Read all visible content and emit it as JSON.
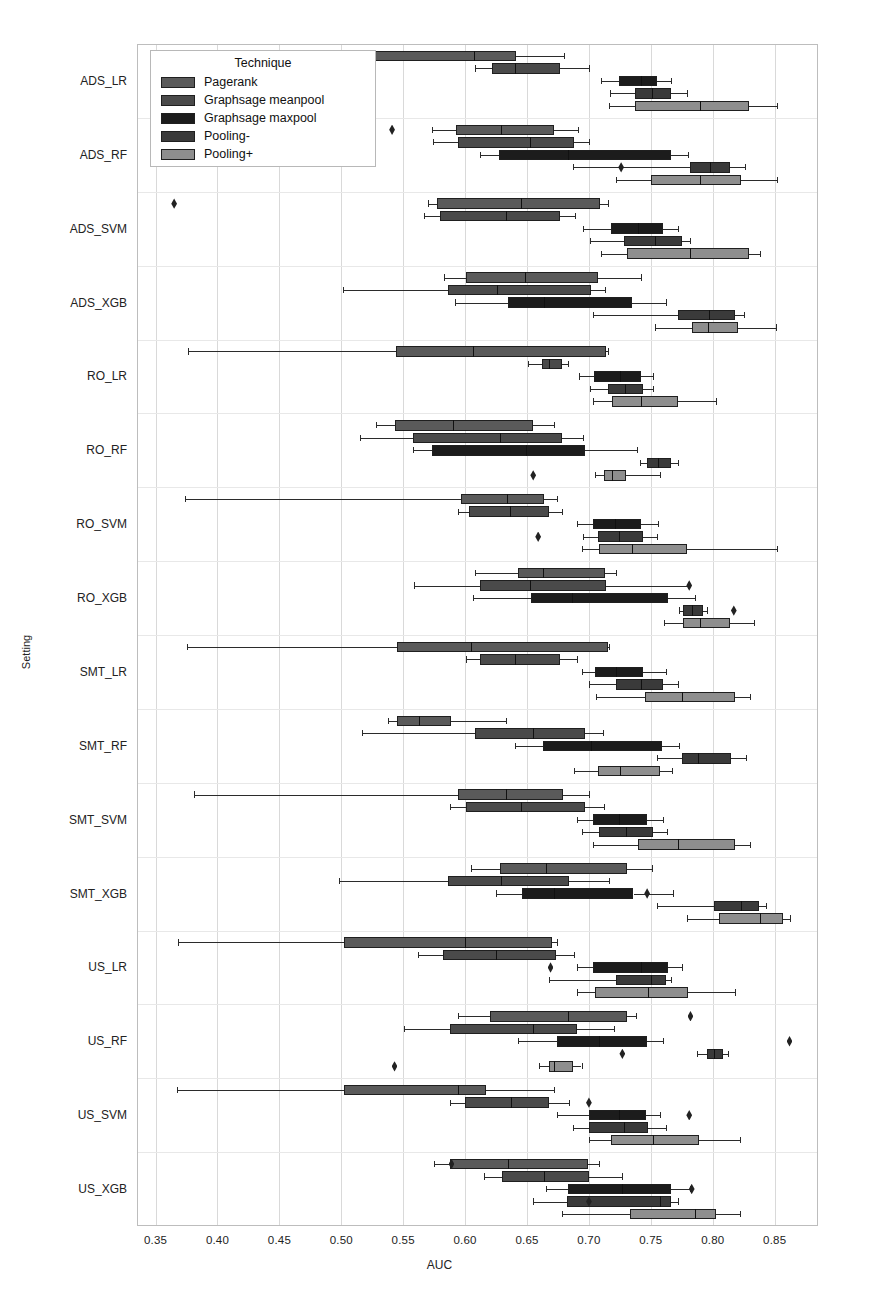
{
  "figure": {
    "width": 879,
    "height": 1304,
    "background": "#ffffff"
  },
  "legend": {
    "title": "Technique",
    "entries": [
      {
        "label": "Pagerank",
        "color": "#5a5a5a"
      },
      {
        "label": "Graphsage meanpool",
        "color": "#4a4a4a"
      },
      {
        "label": "Graphsage maxpool",
        "color": "#1c1c1c"
      },
      {
        "label": "Pooling-",
        "color": "#3a3a3a"
      },
      {
        "label": "Pooling+",
        "color": "#8e8e8e"
      }
    ]
  },
  "axes": {
    "xlabel": "AUC",
    "ylabel": "Setting",
    "xticks": [
      "0.35",
      "0.40",
      "0.45",
      "0.50",
      "0.55",
      "0.60",
      "0.65",
      "0.70",
      "0.75",
      "0.80",
      "0.85"
    ],
    "xtick_values": [
      0.35,
      0.4,
      0.45,
      0.5,
      0.55,
      0.6,
      0.65,
      0.7,
      0.75,
      0.8,
      0.85
    ],
    "xlim": [
      0.335,
      0.885
    ],
    "grid": "vertical"
  },
  "chart_data": {
    "type": "box",
    "orientation": "horizontal",
    "title": "",
    "xlabel": "AUC",
    "ylabel": "Setting",
    "xlim": [
      0.335,
      0.885
    ],
    "xticks": [
      0.35,
      0.4,
      0.45,
      0.5,
      0.55,
      0.6,
      0.65,
      0.7,
      0.75,
      0.8,
      0.85
    ],
    "legend_title": "Technique",
    "legend_position": "upper left",
    "categories": [
      "ADS_LR",
      "ADS_RF",
      "ADS_SVM",
      "ADS_XGB",
      "RO_LR",
      "RO_RF",
      "RO_SVM",
      "RO_XGB",
      "SMT_LR",
      "SMT_RF",
      "SMT_SVM",
      "SMT_XGB",
      "US_LR",
      "US_RF",
      "US_SVM",
      "US_XGB"
    ],
    "series": [
      {
        "name": "Pagerank",
        "color": "#5a5a5a"
      },
      {
        "name": "Graphsage meanpool",
        "color": "#4a4a4a"
      },
      {
        "name": "Graphsage maxpool",
        "color": "#1c1c1c"
      },
      {
        "name": "Pooling-",
        "color": "#3a3a3a"
      },
      {
        "name": "Pooling+",
        "color": "#8e8e8e"
      }
    ],
    "boxes": [
      {
        "setting": "ADS_LR",
        "technique": "Pagerank",
        "whislo": 0.527,
        "q1": 0.527,
        "med": 0.607,
        "q3": 0.641,
        "whishi": 0.68,
        "fliers": []
      },
      {
        "setting": "ADS_LR",
        "technique": "Graphsage meanpool",
        "whislo": 0.608,
        "q1": 0.622,
        "med": 0.64,
        "q3": 0.677,
        "whishi": 0.7,
        "fliers": []
      },
      {
        "setting": "ADS_LR",
        "technique": "Graphsage maxpool",
        "whislo": 0.71,
        "q1": 0.724,
        "med": 0.742,
        "q3": 0.755,
        "whishi": 0.766,
        "fliers": []
      },
      {
        "setting": "ADS_LR",
        "technique": "Pooling-",
        "whislo": 0.717,
        "q1": 0.737,
        "med": 0.751,
        "q3": 0.766,
        "whishi": 0.779,
        "fliers": []
      },
      {
        "setting": "ADS_LR",
        "technique": "Pooling+",
        "whislo": 0.716,
        "q1": 0.737,
        "med": 0.79,
        "q3": 0.829,
        "whishi": 0.852,
        "fliers": []
      },
      {
        "setting": "ADS_RF",
        "technique": "Pagerank",
        "whislo": 0.573,
        "q1": 0.593,
        "med": 0.629,
        "q3": 0.672,
        "whishi": 0.691,
        "fliers": [
          0.541
        ]
      },
      {
        "setting": "ADS_RF",
        "technique": "Graphsage meanpool",
        "whislo": 0.574,
        "q1": 0.594,
        "med": 0.652,
        "q3": 0.688,
        "whishi": 0.7,
        "fliers": []
      },
      {
        "setting": "ADS_RF",
        "technique": "Graphsage maxpool",
        "whislo": 0.612,
        "q1": 0.627,
        "med": 0.683,
        "q3": 0.766,
        "whishi": 0.78,
        "fliers": []
      },
      {
        "setting": "ADS_RF",
        "technique": "Pooling-",
        "whislo": 0.687,
        "q1": 0.782,
        "med": 0.798,
        "q3": 0.814,
        "whishi": 0.826,
        "fliers": [
          0.726
        ]
      },
      {
        "setting": "ADS_RF",
        "technique": "Pooling+",
        "whislo": 0.722,
        "q1": 0.75,
        "med": 0.79,
        "q3": 0.823,
        "whishi": 0.852,
        "fliers": []
      },
      {
        "setting": "ADS_SVM",
        "technique": "Pagerank",
        "whislo": 0.57,
        "q1": 0.577,
        "med": 0.645,
        "q3": 0.709,
        "whishi": 0.715,
        "fliers": [
          0.365
        ]
      },
      {
        "setting": "ADS_SVM",
        "technique": "Graphsage meanpool",
        "whislo": 0.567,
        "q1": 0.58,
        "med": 0.633,
        "q3": 0.677,
        "whishi": 0.689,
        "fliers": []
      },
      {
        "setting": "ADS_SVM",
        "technique": "Graphsage maxpool",
        "whislo": 0.695,
        "q1": 0.718,
        "med": 0.74,
        "q3": 0.76,
        "whishi": 0.772,
        "fliers": []
      },
      {
        "setting": "ADS_SVM",
        "technique": "Pooling-",
        "whislo": 0.701,
        "q1": 0.728,
        "med": 0.753,
        "q3": 0.775,
        "whishi": 0.782,
        "fliers": []
      },
      {
        "setting": "ADS_SVM",
        "technique": "Pooling+",
        "whislo": 0.71,
        "q1": 0.731,
        "med": 0.782,
        "q3": 0.829,
        "whishi": 0.838,
        "fliers": []
      },
      {
        "setting": "ADS_XGB",
        "technique": "Pagerank",
        "whislo": 0.583,
        "q1": 0.601,
        "med": 0.648,
        "q3": 0.707,
        "whishi": 0.742,
        "fliers": []
      },
      {
        "setting": "ADS_XGB",
        "technique": "Graphsage meanpool",
        "whislo": 0.501,
        "q1": 0.586,
        "med": 0.626,
        "q3": 0.702,
        "whishi": 0.713,
        "fliers": []
      },
      {
        "setting": "ADS_XGB",
        "technique": "Graphsage maxpool",
        "whislo": 0.592,
        "q1": 0.635,
        "med": 0.664,
        "q3": 0.735,
        "whishi": 0.762,
        "fliers": []
      },
      {
        "setting": "ADS_XGB",
        "technique": "Pooling-",
        "whislo": 0.703,
        "q1": 0.772,
        "med": 0.797,
        "q3": 0.818,
        "whishi": 0.825,
        "fliers": []
      },
      {
        "setting": "ADS_XGB",
        "technique": "Pooling+",
        "whislo": 0.753,
        "q1": 0.783,
        "med": 0.796,
        "q3": 0.82,
        "whishi": 0.851,
        "fliers": []
      },
      {
        "setting": "RO_LR",
        "technique": "Pagerank",
        "whislo": 0.376,
        "q1": 0.544,
        "med": 0.606,
        "q3": 0.714,
        "whishi": 0.715,
        "fliers": []
      },
      {
        "setting": "RO_LR",
        "technique": "Graphsage meanpool",
        "whislo": 0.651,
        "q1": 0.662,
        "med": 0.668,
        "q3": 0.678,
        "whishi": 0.683,
        "fliers": []
      },
      {
        "setting": "RO_LR",
        "technique": "Graphsage maxpool",
        "whislo": 0.692,
        "q1": 0.704,
        "med": 0.725,
        "q3": 0.742,
        "whishi": 0.752,
        "fliers": []
      },
      {
        "setting": "RO_LR",
        "technique": "Pooling-",
        "whislo": 0.701,
        "q1": 0.715,
        "med": 0.729,
        "q3": 0.744,
        "whishi": 0.752,
        "fliers": []
      },
      {
        "setting": "RO_LR",
        "technique": "Pooling+",
        "whislo": 0.703,
        "q1": 0.719,
        "med": 0.742,
        "q3": 0.772,
        "whishi": 0.803,
        "fliers": []
      },
      {
        "setting": "RO_RF",
        "technique": "Pagerank",
        "whislo": 0.528,
        "q1": 0.543,
        "med": 0.59,
        "q3": 0.655,
        "whishi": 0.672,
        "fliers": []
      },
      {
        "setting": "RO_RF",
        "technique": "Graphsage meanpool",
        "whislo": 0.515,
        "q1": 0.558,
        "med": 0.628,
        "q3": 0.678,
        "whishi": 0.695,
        "fliers": []
      },
      {
        "setting": "RO_RF",
        "technique": "Graphsage maxpool",
        "whislo": 0.558,
        "q1": 0.573,
        "med": 0.649,
        "q3": 0.697,
        "whishi": 0.739,
        "fliers": []
      },
      {
        "setting": "RO_RF",
        "technique": "Pooling-",
        "whislo": 0.741,
        "q1": 0.747,
        "med": 0.756,
        "q3": 0.766,
        "whishi": 0.772,
        "fliers": []
      },
      {
        "setting": "RO_RF",
        "technique": "Pooling+",
        "whislo": 0.705,
        "q1": 0.712,
        "med": 0.719,
        "q3": 0.73,
        "whishi": 0.757,
        "fliers": [
          0.655
        ]
      },
      {
        "setting": "RO_SVM",
        "technique": "Pagerank",
        "whislo": 0.374,
        "q1": 0.597,
        "med": 0.634,
        "q3": 0.664,
        "whishi": 0.674,
        "fliers": []
      },
      {
        "setting": "RO_SVM",
        "technique": "Graphsage meanpool",
        "whislo": 0.594,
        "q1": 0.603,
        "med": 0.636,
        "q3": 0.668,
        "whishi": 0.678,
        "fliers": []
      },
      {
        "setting": "RO_SVM",
        "technique": "Graphsage maxpool",
        "whislo": 0.69,
        "q1": 0.703,
        "med": 0.721,
        "q3": 0.742,
        "whishi": 0.756,
        "fliers": []
      },
      {
        "setting": "RO_SVM",
        "technique": "Pooling-",
        "whislo": 0.695,
        "q1": 0.707,
        "med": 0.724,
        "q3": 0.744,
        "whishi": 0.755,
        "fliers": [
          0.659
        ]
      },
      {
        "setting": "RO_SVM",
        "technique": "Pooling+",
        "whislo": 0.694,
        "q1": 0.708,
        "med": 0.735,
        "q3": 0.779,
        "whishi": 0.852,
        "fliers": []
      },
      {
        "setting": "RO_XGB",
        "technique": "Pagerank",
        "whislo": 0.608,
        "q1": 0.643,
        "med": 0.663,
        "q3": 0.713,
        "whishi": 0.722,
        "fliers": []
      },
      {
        "setting": "RO_XGB",
        "technique": "Graphsage meanpool",
        "whislo": 0.559,
        "q1": 0.612,
        "med": 0.652,
        "q3": 0.714,
        "whishi": 0.78,
        "fliers": [
          0.781
        ]
      },
      {
        "setting": "RO_XGB",
        "technique": "Graphsage maxpool",
        "whislo": 0.606,
        "q1": 0.653,
        "med": 0.686,
        "q3": 0.764,
        "whishi": 0.786,
        "fliers": []
      },
      {
        "setting": "RO_XGB",
        "technique": "Pooling-",
        "whislo": 0.773,
        "q1": 0.776,
        "med": 0.783,
        "q3": 0.792,
        "whishi": 0.795,
        "fliers": [
          0.817
        ]
      },
      {
        "setting": "RO_XGB",
        "technique": "Pooling+",
        "whislo": 0.761,
        "q1": 0.776,
        "med": 0.79,
        "q3": 0.814,
        "whishi": 0.833,
        "fliers": []
      },
      {
        "setting": "SMT_LR",
        "technique": "Pagerank",
        "whislo": 0.375,
        "q1": 0.545,
        "med": 0.605,
        "q3": 0.715,
        "whishi": 0.716,
        "fliers": []
      },
      {
        "setting": "SMT_LR",
        "technique": "Graphsage meanpool",
        "whislo": 0.601,
        "q1": 0.612,
        "med": 0.64,
        "q3": 0.677,
        "whishi": 0.69,
        "fliers": []
      },
      {
        "setting": "SMT_LR",
        "technique": "Graphsage maxpool",
        "whislo": 0.694,
        "q1": 0.705,
        "med": 0.722,
        "q3": 0.744,
        "whishi": 0.762,
        "fliers": []
      },
      {
        "setting": "SMT_LR",
        "technique": "Pooling-",
        "whislo": 0.7,
        "q1": 0.722,
        "med": 0.742,
        "q3": 0.76,
        "whishi": 0.772,
        "fliers": []
      },
      {
        "setting": "SMT_LR",
        "technique": "Pooling+",
        "whislo": 0.706,
        "q1": 0.745,
        "med": 0.775,
        "q3": 0.818,
        "whishi": 0.83,
        "fliers": []
      },
      {
        "setting": "SMT_RF",
        "technique": "Pagerank",
        "whislo": 0.538,
        "q1": 0.545,
        "med": 0.563,
        "q3": 0.589,
        "whishi": 0.633,
        "fliers": []
      },
      {
        "setting": "SMT_RF",
        "technique": "Graphsage meanpool",
        "whislo": 0.517,
        "q1": 0.608,
        "med": 0.655,
        "q3": 0.697,
        "whishi": 0.711,
        "fliers": []
      },
      {
        "setting": "SMT_RF",
        "technique": "Graphsage maxpool",
        "whislo": 0.64,
        "q1": 0.663,
        "med": 0.702,
        "q3": 0.759,
        "whishi": 0.773,
        "fliers": []
      },
      {
        "setting": "SMT_RF",
        "technique": "Pooling-",
        "whislo": 0.755,
        "q1": 0.775,
        "med": 0.788,
        "q3": 0.815,
        "whishi": 0.827,
        "fliers": []
      },
      {
        "setting": "SMT_RF",
        "technique": "Pooling+",
        "whislo": 0.688,
        "q1": 0.707,
        "med": 0.725,
        "q3": 0.757,
        "whishi": 0.767,
        "fliers": []
      },
      {
        "setting": "SMT_SVM",
        "technique": "Pagerank",
        "whislo": 0.381,
        "q1": 0.594,
        "med": 0.633,
        "q3": 0.679,
        "whishi": 0.7,
        "fliers": []
      },
      {
        "setting": "SMT_SVM",
        "technique": "Graphsage meanpool",
        "whislo": 0.588,
        "q1": 0.601,
        "med": 0.645,
        "q3": 0.697,
        "whishi": 0.712,
        "fliers": []
      },
      {
        "setting": "SMT_SVM",
        "technique": "Graphsage maxpool",
        "whislo": 0.69,
        "q1": 0.703,
        "med": 0.724,
        "q3": 0.747,
        "whishi": 0.76,
        "fliers": []
      },
      {
        "setting": "SMT_SVM",
        "technique": "Pooling-",
        "whislo": 0.694,
        "q1": 0.708,
        "med": 0.73,
        "q3": 0.752,
        "whishi": 0.763,
        "fliers": []
      },
      {
        "setting": "SMT_SVM",
        "technique": "Pooling+",
        "whislo": 0.703,
        "q1": 0.74,
        "med": 0.772,
        "q3": 0.818,
        "whishi": 0.83,
        "fliers": []
      },
      {
        "setting": "SMT_XGB",
        "technique": "Pagerank",
        "whislo": 0.605,
        "q1": 0.628,
        "med": 0.665,
        "q3": 0.731,
        "whishi": 0.751,
        "fliers": []
      },
      {
        "setting": "SMT_XGB",
        "technique": "Graphsage meanpool",
        "whislo": 0.498,
        "q1": 0.586,
        "med": 0.629,
        "q3": 0.684,
        "whishi": 0.716,
        "fliers": []
      },
      {
        "setting": "SMT_XGB",
        "technique": "Graphsage maxpool",
        "whislo": 0.625,
        "q1": 0.646,
        "med": 0.672,
        "q3": 0.736,
        "whishi": 0.768,
        "fliers": [
          0.747
        ]
      },
      {
        "setting": "SMT_XGB",
        "technique": "Pooling-",
        "whislo": 0.755,
        "q1": 0.801,
        "med": 0.823,
        "q3": 0.837,
        "whishi": 0.843,
        "fliers": []
      },
      {
        "setting": "SMT_XGB",
        "technique": "Pooling+",
        "whislo": 0.779,
        "q1": 0.805,
        "med": 0.838,
        "q3": 0.857,
        "whishi": 0.862,
        "fliers": []
      },
      {
        "setting": "US_LR",
        "technique": "Pagerank",
        "whislo": 0.368,
        "q1": 0.502,
        "med": 0.6,
        "q3": 0.67,
        "whishi": 0.674,
        "fliers": []
      },
      {
        "setting": "US_LR",
        "technique": "Graphsage meanpool",
        "whislo": 0.562,
        "q1": 0.582,
        "med": 0.625,
        "q3": 0.673,
        "whishi": 0.688,
        "fliers": []
      },
      {
        "setting": "US_LR",
        "technique": "Graphsage maxpool",
        "whislo": 0.69,
        "q1": 0.703,
        "med": 0.742,
        "q3": 0.764,
        "whishi": 0.775,
        "fliers": [
          0.669
        ]
      },
      {
        "setting": "US_LR",
        "technique": "Pooling-",
        "whislo": 0.668,
        "q1": 0.722,
        "med": 0.75,
        "q3": 0.762,
        "whishi": 0.766,
        "fliers": []
      },
      {
        "setting": "US_LR",
        "technique": "Pooling+",
        "whislo": 0.69,
        "q1": 0.705,
        "med": 0.748,
        "q3": 0.78,
        "whishi": 0.818,
        "fliers": []
      },
      {
        "setting": "US_RF",
        "technique": "Pagerank",
        "whislo": 0.594,
        "q1": 0.62,
        "med": 0.683,
        "q3": 0.731,
        "whishi": 0.738,
        "fliers": [
          0.782
        ]
      },
      {
        "setting": "US_RF",
        "technique": "Graphsage meanpool",
        "whislo": 0.551,
        "q1": 0.588,
        "med": 0.655,
        "q3": 0.69,
        "whishi": 0.72,
        "fliers": []
      },
      {
        "setting": "US_RF",
        "technique": "Graphsage maxpool",
        "whislo": 0.643,
        "q1": 0.674,
        "med": 0.708,
        "q3": 0.747,
        "whishi": 0.76,
        "fliers": [
          0.862
        ]
      },
      {
        "setting": "US_RF",
        "technique": "Pooling-",
        "whislo": 0.787,
        "q1": 0.795,
        "med": 0.801,
        "q3": 0.808,
        "whishi": 0.812,
        "fliers": [
          0.727
        ]
      },
      {
        "setting": "US_RF",
        "technique": "Pooling+",
        "whislo": 0.66,
        "q1": 0.668,
        "med": 0.672,
        "q3": 0.687,
        "whishi": 0.694,
        "fliers": [
          0.543
        ]
      },
      {
        "setting": "US_SVM",
        "technique": "Pagerank",
        "whislo": 0.367,
        "q1": 0.502,
        "med": 0.594,
        "q3": 0.617,
        "whishi": 0.672,
        "fliers": []
      },
      {
        "setting": "US_SVM",
        "technique": "Graphsage meanpool",
        "whislo": 0.588,
        "q1": 0.6,
        "med": 0.637,
        "q3": 0.668,
        "whishi": 0.684,
        "fliers": [
          0.7
        ]
      },
      {
        "setting": "US_SVM",
        "technique": "Graphsage maxpool",
        "whislo": 0.674,
        "q1": 0.7,
        "med": 0.724,
        "q3": 0.746,
        "whishi": 0.757,
        "fliers": [
          0.781
        ]
      },
      {
        "setting": "US_SVM",
        "technique": "Pooling-",
        "whislo": 0.687,
        "q1": 0.7,
        "med": 0.728,
        "q3": 0.748,
        "whishi": 0.762,
        "fliers": []
      },
      {
        "setting": "US_SVM",
        "technique": "Pooling+",
        "whislo": 0.7,
        "q1": 0.718,
        "med": 0.752,
        "q3": 0.789,
        "whishi": 0.822,
        "fliers": []
      },
      {
        "setting": "US_XGB",
        "technique": "Pagerank",
        "whislo": 0.575,
        "q1": 0.588,
        "med": 0.635,
        "q3": 0.699,
        "whishi": 0.708,
        "fliers": [
          0.589
        ]
      },
      {
        "setting": "US_XGB",
        "technique": "Graphsage meanpool",
        "whislo": 0.615,
        "q1": 0.63,
        "med": 0.664,
        "q3": 0.7,
        "whishi": 0.727,
        "fliers": []
      },
      {
        "setting": "US_XGB",
        "technique": "Graphsage maxpool",
        "whislo": 0.665,
        "q1": 0.683,
        "med": 0.727,
        "q3": 0.766,
        "whishi": 0.782,
        "fliers": [
          0.783
        ]
      },
      {
        "setting": "US_XGB",
        "technique": "Pooling-",
        "whislo": 0.655,
        "q1": 0.682,
        "med": 0.757,
        "q3": 0.766,
        "whishi": 0.772,
        "fliers": [
          0.7
        ]
      },
      {
        "setting": "US_XGB",
        "technique": "Pooling+",
        "whislo": 0.678,
        "q1": 0.733,
        "med": 0.786,
        "q3": 0.803,
        "whishi": 0.822,
        "fliers": []
      }
    ]
  }
}
